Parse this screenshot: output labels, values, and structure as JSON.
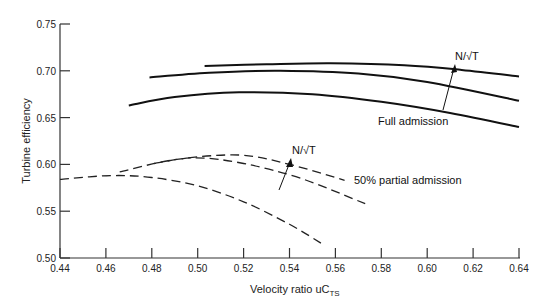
{
  "chart_data": {
    "type": "line",
    "title": "",
    "xlabel": "Velocity ratio uC",
    "xlabel_subscript": "TS",
    "ylabel": "Turbine efficiency",
    "xlim": [
      0.44,
      0.64
    ],
    "ylim": [
      0.5,
      0.75
    ],
    "x_ticks": [
      "0.44",
      "0.46",
      "0.48",
      "0.50",
      "0.52",
      "0.54",
      "0.56",
      "0.58",
      "0.60",
      "0.62",
      "0.64"
    ],
    "y_ticks": [
      "0.50",
      "0.55",
      "0.60",
      "0.65",
      "0.70",
      "0.75"
    ],
    "grid": false,
    "series": [
      {
        "name": "Full admission (low N/√T)",
        "style": "solid",
        "x": [
          0.47,
          0.49,
          0.518,
          0.55,
          0.58,
          0.61,
          0.64
        ],
        "y": [
          0.663,
          0.672,
          0.677,
          0.675,
          0.667,
          0.655,
          0.64
        ]
      },
      {
        "name": "Full admission (mid N/√T)",
        "style": "solid",
        "x": [
          0.479,
          0.505,
          0.536,
          0.57,
          0.6,
          0.64
        ],
        "y": [
          0.693,
          0.698,
          0.7,
          0.697,
          0.688,
          0.668
        ]
      },
      {
        "name": "Full admission (high N/√T)",
        "style": "solid",
        "x": [
          0.503,
          0.53,
          0.558,
          0.59,
          0.615,
          0.64
        ],
        "y": [
          0.705,
          0.707,
          0.708,
          0.706,
          0.701,
          0.694
        ]
      },
      {
        "name": "50% partial admission (low N/√T)",
        "style": "dashed",
        "x": [
          0.44,
          0.462,
          0.48,
          0.5,
          0.52,
          0.54,
          0.555
        ],
        "y": [
          0.584,
          0.588,
          0.586,
          0.577,
          0.56,
          0.536,
          0.514
        ]
      },
      {
        "name": "50% partial admission (mid N/√T)",
        "style": "dashed",
        "x": [
          0.481,
          0.499,
          0.52,
          0.545,
          0.573
        ],
        "y": [
          0.601,
          0.607,
          0.601,
          0.585,
          0.558
        ]
      },
      {
        "name": "50% partial admission (high N/√T)",
        "style": "dashed",
        "x": [
          0.466,
          0.49,
          0.518,
          0.54,
          0.564
        ],
        "y": [
          0.592,
          0.605,
          0.61,
          0.6,
          0.583
        ]
      }
    ],
    "annotations": [
      {
        "text": "N/√T",
        "meaning": "arrow indicates increasing N/√T (full admission)",
        "x": 0.6165,
        "y": 0.7065
      },
      {
        "text": "Full admission",
        "x": 0.596,
        "y": 0.658
      },
      {
        "text": "N/√T",
        "meaning": "arrow indicates increasing N/√T (partial admission)",
        "x": 0.5435,
        "y": 0.614
      },
      {
        "text": "50% partial admission",
        "x": 0.568,
        "y": 0.58
      }
    ]
  }
}
